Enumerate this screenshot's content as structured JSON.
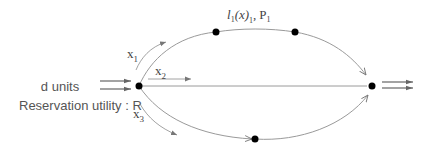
{
  "diagram": {
    "input": {
      "demand_label": "d units",
      "reservation_label": "Reservation utility : R"
    },
    "top_link_label": {
      "latency": "l",
      "latency_sub": "1",
      "arg": "(x",
      "arg_close": ")",
      "arg_sub": "1",
      "separator": ",",
      "price": "P",
      "price_sub": "1"
    },
    "flows": [
      {
        "name": "x",
        "sub": "1"
      },
      {
        "name": "x",
        "sub": "2"
      },
      {
        "name": "x",
        "sub": "3"
      }
    ],
    "nodes": [
      "source",
      "top-node-1",
      "top-node-2",
      "bottom-node",
      "sink"
    ],
    "colors": {
      "edge": "#9a9a9a",
      "node": "#000000",
      "text": "#555555"
    }
  }
}
